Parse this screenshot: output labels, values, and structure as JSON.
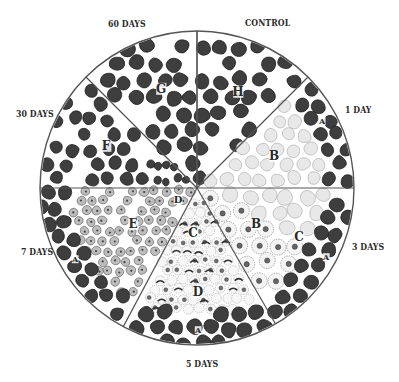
{
  "figure": {
    "type": "pie-segmented histology diagram",
    "center": [
      197,
      188
    ],
    "radius": 157,
    "colors": {
      "outline": "#555555",
      "healthy_fiber": "#3e3e3e",
      "healthy_fiber_edge": "#222222",
      "pale_fiber": "#e8e8e8",
      "pale_fiber_edge": "#a8a8a8",
      "nucleated_cell": "#bdbdbd",
      "nucleated_cell_edge": "#666666",
      "nucleus": "#444444",
      "background": "#ffffff"
    }
  },
  "labels": {
    "days_60": "60 DAYS",
    "control": "CONTROL",
    "days_30": "30 DAYS",
    "day_1": "1 DAY",
    "days_7": "7 DAYS",
    "days_3": "3 DAYS",
    "days_5": "5 DAYS"
  },
  "sectors": [
    {
      "id": "control",
      "label": "CONTROL",
      "start_deg": -90,
      "end_deg": -45,
      "letters": [
        {
          "text": "H",
          "x": 238,
          "y": 96
        }
      ],
      "fill": "healthy"
    },
    {
      "id": "day-1",
      "label": "1 DAY",
      "start_deg": -45,
      "end_deg": 0,
      "letters": [
        {
          "text": "A",
          "x": 322,
          "y": 124,
          "size": 8
        },
        {
          "text": "B",
          "x": 274,
          "y": 160
        }
      ],
      "fill": "pale-with-rim"
    },
    {
      "id": "days-3",
      "label": "3 DAYS",
      "start_deg": 0,
      "end_deg": 60,
      "letters": [
        {
          "text": "B",
          "x": 256,
          "y": 228
        },
        {
          "text": "C",
          "x": 299,
          "y": 241
        },
        {
          "text": "A",
          "x": 326,
          "y": 260,
          "size": 8
        }
      ],
      "fill": "pale-nucleated-rim"
    },
    {
      "id": "days-5",
      "label": "5 DAYS",
      "start_deg": 60,
      "end_deg": 118,
      "letters": [
        {
          "text": "C",
          "x": 193,
          "y": 237
        },
        {
          "text": "D",
          "x": 198,
          "y": 296
        },
        {
          "text": "A",
          "x": 198,
          "y": 333,
          "size": 8
        }
      ],
      "fill": "necrotic-rim"
    },
    {
      "id": "days-7",
      "label": "7 DAYS",
      "start_deg": 118,
      "end_deg": 180,
      "letters": [
        {
          "text": "D",
          "x": 178,
          "y": 203,
          "size": 10
        },
        {
          "text": "E",
          "x": 133,
          "y": 228
        },
        {
          "text": "A",
          "x": 75,
          "y": 262,
          "size": 8
        }
      ],
      "fill": "regenerating-rim"
    },
    {
      "id": "days-30",
      "label": "30 DAYS",
      "start_deg": 180,
      "end_deg": 225,
      "letters": [
        {
          "text": "F",
          "x": 106,
          "y": 150
        }
      ],
      "fill": "healthy-small"
    },
    {
      "id": "days-60",
      "label": "60 DAYS",
      "start_deg": 225,
      "end_deg": 270,
      "letters": [
        {
          "text": "G",
          "x": 161,
          "y": 93
        }
      ],
      "fill": "healthy"
    }
  ]
}
